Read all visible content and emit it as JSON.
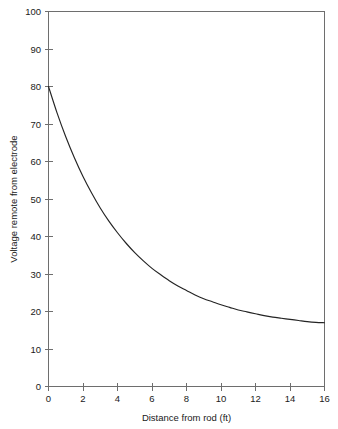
{
  "chart_data": {
    "type": "line",
    "title": "",
    "xlabel": "Distance from rod (ft)",
    "ylabel": "Voltage remote from electrode",
    "xlim": [
      0,
      16
    ],
    "ylim": [
      0,
      100
    ],
    "xticks": [
      0,
      2,
      4,
      6,
      8,
      10,
      12,
      14,
      16
    ],
    "xtick_labels": [
      "0",
      "2",
      "4",
      "6",
      "8",
      "10",
      "12",
      "14",
      "16"
    ],
    "yticks": [
      0,
      10,
      20,
      30,
      40,
      50,
      60,
      70,
      80,
      90,
      100
    ],
    "ytick_labels": [
      "0",
      "10",
      "20",
      "30",
      "40",
      "50",
      "60",
      "70",
      "80",
      "90",
      "100"
    ],
    "grid": false,
    "legend": false,
    "legend_position": "none",
    "series": [
      {
        "name": "Voltage decay",
        "color": "#242424",
        "x": [
          0,
          0.5,
          1,
          1.5,
          2,
          2.5,
          3,
          3.5,
          4,
          4.5,
          5,
          5.5,
          6,
          6.5,
          7,
          7.5,
          8,
          8.5,
          9,
          9.5,
          10,
          10.5,
          11,
          11.5,
          12,
          12.5,
          13,
          13.5,
          14,
          14.5,
          15,
          15.5,
          16
        ],
        "values": [
          80.0,
          72.9,
          66.6,
          61.0,
          56.0,
          51.6,
          47.6,
          44.1,
          41.0,
          38.2,
          35.7,
          33.5,
          31.5,
          29.8,
          28.2,
          26.8,
          25.6,
          24.4,
          23.4,
          22.6,
          21.8,
          21.1,
          20.4,
          19.9,
          19.4,
          18.9,
          18.5,
          18.2,
          17.9,
          17.6,
          17.3,
          17.1,
          17.0
        ]
      }
    ],
    "annotations": []
  },
  "axes": {
    "x_axis_title": "Distance from rod (ft)",
    "y_axis_title": "Voltage remote from electrode"
  }
}
